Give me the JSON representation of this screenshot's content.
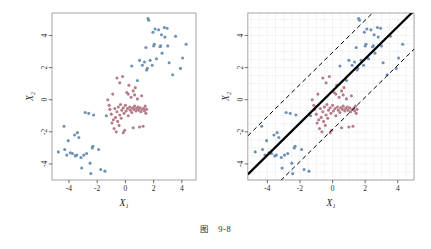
{
  "caption": {
    "label": "图",
    "number": "9-8"
  },
  "chart_data": [
    {
      "type": "scatter",
      "panel": "left",
      "title": "",
      "xlabel": "X₁",
      "ylabel": "X₂",
      "xlim": [
        -5.2,
        5.0
      ],
      "ylim": [
        -5.0,
        5.4
      ],
      "xticks": [
        -4,
        -2,
        0,
        2,
        4
      ],
      "yticks": [
        -4,
        -2,
        0,
        2,
        4
      ],
      "xticklabels": [
        "-4",
        "-2",
        "0",
        "2",
        "4"
      ],
      "yticklabels": [
        "-4",
        "-2",
        "0",
        "2",
        "4"
      ],
      "grid": false,
      "legend": "none",
      "series": [
        {
          "name": "class-blue",
          "color": "#6f91b3",
          "marker": "circle",
          "points": [
            [
              -4.75,
              -3.25
            ],
            [
              -4.35,
              -1.65
            ],
            [
              -4.3,
              -3.1
            ],
            [
              -4.15,
              -3.45
            ],
            [
              -4.05,
              -2.55
            ],
            [
              -3.9,
              -3.3
            ],
            [
              -3.75,
              -3.35
            ],
            [
              -3.6,
              -2.2
            ],
            [
              -3.55,
              -3.5
            ],
            [
              -3.45,
              -3.45
            ],
            [
              -3.4,
              -2.05
            ],
            [
              -3.3,
              -2.35
            ],
            [
              -3.15,
              -3.6
            ],
            [
              -3.1,
              -4.25
            ],
            [
              -2.95,
              -3.45
            ],
            [
              -2.85,
              -0.8
            ],
            [
              -2.75,
              -3.35
            ],
            [
              -2.6,
              -0.85
            ],
            [
              -2.5,
              -3.95
            ],
            [
              -2.45,
              -4.6
            ],
            [
              -2.35,
              -3.0
            ],
            [
              -2.3,
              -2.9
            ],
            [
              -2.25,
              -0.95
            ],
            [
              -1.9,
              -3.1
            ],
            [
              -1.75,
              -4.35
            ],
            [
              -1.45,
              -4.45
            ],
            [
              -1.35,
              -1.0
            ],
            [
              0.45,
              2.1
            ],
            [
              0.85,
              1.2
            ],
            [
              1.0,
              2.45
            ],
            [
              1.2,
              2.15
            ],
            [
              1.35,
              2.35
            ],
            [
              1.45,
              3.25
            ],
            [
              1.5,
              1.85
            ],
            [
              1.55,
              1.95
            ],
            [
              1.6,
              5.05
            ],
            [
              1.65,
              4.95
            ],
            [
              1.75,
              2.45
            ],
            [
              1.9,
              2.15
            ],
            [
              1.95,
              4.2
            ],
            [
              2.0,
              3.35
            ],
            [
              2.05,
              3.45
            ],
            [
              2.1,
              4.4
            ],
            [
              2.2,
              2.55
            ],
            [
              2.35,
              4.35
            ],
            [
              2.45,
              3.3
            ],
            [
              2.5,
              3.35
            ],
            [
              2.55,
              4.05
            ],
            [
              2.6,
              2.9
            ],
            [
              2.75,
              4.5
            ],
            [
              2.8,
              3.9
            ],
            [
              2.95,
              4.45
            ],
            [
              3.0,
              3.35
            ],
            [
              3.1,
              2.3
            ],
            [
              3.35,
              1.55
            ],
            [
              3.55,
              3.95
            ],
            [
              3.9,
              1.95
            ],
            [
              4.05,
              2.6
            ],
            [
              4.3,
              3.45
            ]
          ]
        },
        {
          "name": "class-red",
          "color": "#b57d88",
          "marker": "circle",
          "points": [
            [
              -1.25,
              0.0
            ],
            [
              -1.1,
              -0.6
            ],
            [
              -1.0,
              -0.9
            ],
            [
              -0.95,
              -1.45
            ],
            [
              -0.9,
              0.35
            ],
            [
              -0.85,
              -1.25
            ],
            [
              -0.8,
              -1.8
            ],
            [
              -0.75,
              -0.55
            ],
            [
              -0.7,
              -1.1
            ],
            [
              -0.65,
              -2.0
            ],
            [
              -0.6,
              -0.75
            ],
            [
              -0.55,
              -1.35
            ],
            [
              -0.5,
              -0.45
            ],
            [
              -0.45,
              -1.6
            ],
            [
              -0.4,
              -0.95
            ],
            [
              -0.35,
              -0.3
            ],
            [
              -0.3,
              -1.15
            ],
            [
              -0.25,
              -0.65
            ],
            [
              -0.2,
              1.45
            ],
            [
              -0.15,
              -0.5
            ],
            [
              -0.1,
              -0.85
            ],
            [
              -0.05,
              -1.9
            ],
            [
              0.0,
              -0.35
            ],
            [
              0.05,
              -0.7
            ],
            [
              0.1,
              0.45
            ],
            [
              0.15,
              -0.55
            ],
            [
              0.2,
              -1.0
            ],
            [
              0.25,
              0.9
            ],
            [
              0.3,
              -0.45
            ],
            [
              0.35,
              -0.65
            ],
            [
              0.4,
              0.15
            ],
            [
              0.45,
              -0.8
            ],
            [
              0.5,
              -0.5
            ],
            [
              0.55,
              0.55
            ],
            [
              0.6,
              -0.6
            ],
            [
              0.65,
              -0.4
            ],
            [
              0.7,
              0.75
            ],
            [
              0.75,
              -0.7
            ],
            [
              0.8,
              -0.55
            ],
            [
              0.85,
              0.05
            ],
            [
              0.9,
              -0.45
            ],
            [
              0.95,
              -0.65
            ],
            [
              1.0,
              -1.7
            ],
            [
              1.05,
              -0.5
            ],
            [
              1.1,
              -0.75
            ],
            [
              1.15,
              0.25
            ],
            [
              1.2,
              -0.6
            ],
            [
              1.25,
              -1.65
            ],
            [
              1.3,
              -0.55
            ],
            [
              1.35,
              -0.7
            ],
            [
              1.4,
              -0.4
            ],
            [
              1.5,
              -0.6
            ],
            [
              -0.6,
              1.35
            ],
            [
              -0.4,
              1.05
            ],
            [
              0.2,
              0.35
            ],
            [
              0.65,
              0.3
            ],
            [
              -0.15,
              -2.05
            ],
            [
              0.55,
              -1.75
            ],
            [
              1.45,
              -0.85
            ],
            [
              -1.15,
              -0.35
            ]
          ]
        }
      ]
    },
    {
      "type": "scatter",
      "panel": "right",
      "title": "",
      "xlabel": "X₁",
      "ylabel": "X₂",
      "xlim": [
        -5.2,
        5.0
      ],
      "ylim": [
        -5.0,
        5.4
      ],
      "xticks": [
        -4,
        -2,
        0,
        2,
        4
      ],
      "yticks": [
        -4,
        -2,
        0,
        2,
        4
      ],
      "xticklabels": [
        "-4",
        "-2",
        "0",
        "2",
        "4"
      ],
      "yticklabels": [
        "-4",
        "-2",
        "0",
        "2",
        "4"
      ],
      "grid": true,
      "grid_style": "dotted",
      "legend": "none",
      "lines": [
        {
          "name": "decision-boundary",
          "style": "solid",
          "color": "#000000",
          "width": 2.2,
          "slope": 1.0,
          "intercept": 0.55
        },
        {
          "name": "upper-margin",
          "style": "dashed",
          "color": "#000000",
          "width": 1.0,
          "slope": 1.0,
          "intercept": 2.95
        },
        {
          "name": "lower-margin",
          "style": "dashed",
          "color": "#000000",
          "width": 1.0,
          "slope": 1.0,
          "intercept": -1.85
        }
      ],
      "series": [
        {
          "name": "class-blue",
          "color": "#6f91b3",
          "marker": "circle",
          "points": [
            [
              -4.75,
              -3.25
            ],
            [
              -4.35,
              -1.65
            ],
            [
              -4.3,
              -3.1
            ],
            [
              -4.15,
              -3.45
            ],
            [
              -4.05,
              -2.55
            ],
            [
              -3.9,
              -3.3
            ],
            [
              -3.75,
              -3.35
            ],
            [
              -3.6,
              -2.2
            ],
            [
              -3.55,
              -3.5
            ],
            [
              -3.45,
              -3.45
            ],
            [
              -3.4,
              -2.05
            ],
            [
              -3.3,
              -2.35
            ],
            [
              -3.15,
              -3.6
            ],
            [
              -3.1,
              -4.25
            ],
            [
              -2.95,
              -3.45
            ],
            [
              -2.85,
              -0.8
            ],
            [
              -2.75,
              -3.35
            ],
            [
              -2.6,
              -0.85
            ],
            [
              -2.5,
              -3.95
            ],
            [
              -2.45,
              -4.6
            ],
            [
              -2.35,
              -3.0
            ],
            [
              -2.3,
              -2.9
            ],
            [
              -2.25,
              -0.95
            ],
            [
              -1.9,
              -3.1
            ],
            [
              -1.75,
              -4.35
            ],
            [
              -1.45,
              -4.45
            ],
            [
              -1.35,
              -1.0
            ],
            [
              0.45,
              2.1
            ],
            [
              0.85,
              1.2
            ],
            [
              1.0,
              2.45
            ],
            [
              1.2,
              2.15
            ],
            [
              1.35,
              2.35
            ],
            [
              1.45,
              3.25
            ],
            [
              1.5,
              1.85
            ],
            [
              1.55,
              1.95
            ],
            [
              1.6,
              5.05
            ],
            [
              1.65,
              4.95
            ],
            [
              1.75,
              2.45
            ],
            [
              1.9,
              2.15
            ],
            [
              1.95,
              4.2
            ],
            [
              2.0,
              3.35
            ],
            [
              2.05,
              3.45
            ],
            [
              2.1,
              4.4
            ],
            [
              2.2,
              2.55
            ],
            [
              2.35,
              4.35
            ],
            [
              2.45,
              3.3
            ],
            [
              2.5,
              3.35
            ],
            [
              2.55,
              4.05
            ],
            [
              2.6,
              2.9
            ],
            [
              2.75,
              4.5
            ],
            [
              2.8,
              3.9
            ],
            [
              2.95,
              4.45
            ],
            [
              3.0,
              3.35
            ],
            [
              3.1,
              2.3
            ],
            [
              3.35,
              1.55
            ],
            [
              3.55,
              3.95
            ],
            [
              3.9,
              1.95
            ],
            [
              4.05,
              2.6
            ],
            [
              4.3,
              3.45
            ]
          ]
        },
        {
          "name": "class-red",
          "color": "#b57d88",
          "marker": "circle",
          "points": [
            [
              -1.25,
              0.0
            ],
            [
              -1.1,
              -0.6
            ],
            [
              -1.0,
              -0.9
            ],
            [
              -0.95,
              -1.45
            ],
            [
              -0.9,
              0.35
            ],
            [
              -0.85,
              -1.25
            ],
            [
              -0.8,
              -1.8
            ],
            [
              -0.75,
              -0.55
            ],
            [
              -0.7,
              -1.1
            ],
            [
              -0.65,
              -2.0
            ],
            [
              -0.6,
              -0.75
            ],
            [
              -0.55,
              -1.35
            ],
            [
              -0.5,
              -0.45
            ],
            [
              -0.45,
              -1.6
            ],
            [
              -0.4,
              -0.95
            ],
            [
              -0.35,
              -0.3
            ],
            [
              -0.3,
              -1.15
            ],
            [
              -0.25,
              -0.65
            ],
            [
              -0.2,
              1.45
            ],
            [
              -0.15,
              -0.5
            ],
            [
              -0.1,
              -0.85
            ],
            [
              -0.05,
              -1.9
            ],
            [
              0.0,
              -0.35
            ],
            [
              0.05,
              -0.7
            ],
            [
              0.1,
              0.45
            ],
            [
              0.15,
              -0.55
            ],
            [
              0.2,
              -1.0
            ],
            [
              0.25,
              0.9
            ],
            [
              0.3,
              -0.45
            ],
            [
              0.35,
              -0.65
            ],
            [
              0.4,
              0.15
            ],
            [
              0.45,
              -0.8
            ],
            [
              0.5,
              -0.5
            ],
            [
              0.55,
              0.55
            ],
            [
              0.6,
              -0.6
            ],
            [
              0.65,
              -0.4
            ],
            [
              0.7,
              0.75
            ],
            [
              0.75,
              -0.7
            ],
            [
              0.8,
              -0.55
            ],
            [
              0.85,
              0.05
            ],
            [
              0.9,
              -0.45
            ],
            [
              0.95,
              -0.65
            ],
            [
              1.0,
              -1.7
            ],
            [
              1.05,
              -0.5
            ],
            [
              1.1,
              -0.75
            ],
            [
              1.15,
              0.25
            ],
            [
              1.2,
              -0.6
            ],
            [
              1.25,
              -1.65
            ],
            [
              1.3,
              -0.55
            ],
            [
              1.35,
              -0.7
            ],
            [
              1.4,
              -0.4
            ],
            [
              1.5,
              -0.6
            ],
            [
              -0.6,
              1.35
            ],
            [
              -0.4,
              1.05
            ],
            [
              0.2,
              0.35
            ],
            [
              0.65,
              0.3
            ],
            [
              -0.15,
              -2.05
            ],
            [
              0.55,
              -1.75
            ],
            [
              1.45,
              -0.85
            ],
            [
              -1.15,
              -0.35
            ]
          ]
        }
      ]
    }
  ]
}
